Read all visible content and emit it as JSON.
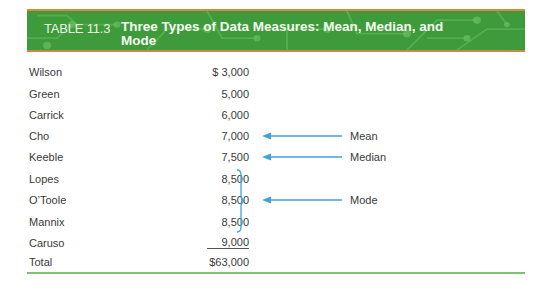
{
  "header": {
    "table_number": "TABLE 11.3",
    "title": "Three Types of Data Measures: Mean, Median, and Mode",
    "colors": {
      "banner_green": "#3e9a3b",
      "banner_border": "#d9893a"
    }
  },
  "rows": [
    {
      "name": "Wilson",
      "value": "$ 3,000"
    },
    {
      "name": "Green",
      "value": "5,000"
    },
    {
      "name": "Carrick",
      "value": "6,000"
    },
    {
      "name": "Cho",
      "value": "7,000"
    },
    {
      "name": "Keeble",
      "value": "7,500"
    },
    {
      "name": "Lopes",
      "value": "8,500"
    },
    {
      "name": "O’Toole",
      "value": "8,500"
    },
    {
      "name": "Mannix",
      "value": "8,500"
    },
    {
      "name": "Caruso",
      "value": "9,000"
    },
    {
      "name": "Total",
      "value": "$63,000"
    }
  ],
  "annotations": {
    "mean": "Mean",
    "median": "Median",
    "mode": "Mode",
    "arrow_color": "#3ea3dc"
  }
}
